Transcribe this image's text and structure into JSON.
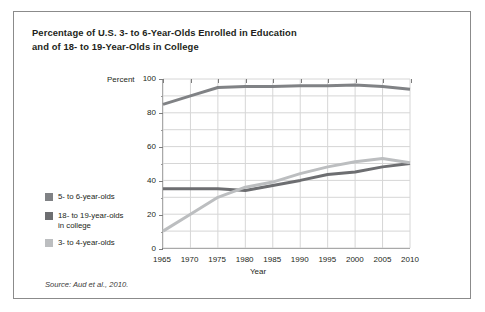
{
  "figure": {
    "title_line1": "Percentage of U.S. 3- to 6-Year-Olds Enrolled in Education",
    "title_line2": "and of 18- to 19-Year-Olds in College",
    "source": "Source: Aud et al., 2010."
  },
  "axes": {
    "y_axis_label": "Percent",
    "x_axis_label": "Year",
    "y_ticks": [
      "0",
      "20",
      "40",
      "60",
      "80",
      "100"
    ],
    "x_ticks": [
      "1965",
      "1970",
      "1975",
      "1980",
      "1985",
      "1990",
      "1995",
      "2000",
      "2005",
      "2010"
    ]
  },
  "legend": {
    "items": [
      {
        "label": "5- to 6-year-olds",
        "color": "#808285"
      },
      {
        "label": "18- to 19-year-olds in college",
        "label_line1": "18- to 19-year-olds",
        "label_line2": "in college",
        "color": "#6d6e71"
      },
      {
        "label": "3- to 4-year-olds",
        "color": "#bcbec0"
      }
    ]
  },
  "chart_data": {
    "type": "line",
    "title": "Percentage of U.S. 3- to 6-Year-Olds Enrolled in Education and of 18- to 19-Year-Olds in College",
    "xlabel": "Year",
    "ylabel": "Percent",
    "x": [
      1965,
      1970,
      1975,
      1980,
      1985,
      1990,
      1995,
      2000,
      2005,
      2010
    ],
    "xlim": [
      1965,
      2010
    ],
    "ylim": [
      0,
      100
    ],
    "grid": true,
    "legend_position": "lower-left-outside",
    "series": [
      {
        "name": "5- to 6-year-olds",
        "color": "#808285",
        "values": [
          85,
          90,
          95,
          95.5,
          95.5,
          96,
          96,
          96.5,
          95.5,
          94
        ]
      },
      {
        "name": "18- to 19-year-olds in college",
        "color": "#6d6e71",
        "values": [
          35,
          35,
          35,
          34,
          37,
          40,
          43.5,
          45,
          48,
          50
        ]
      },
      {
        "name": "3- to 4-year-olds",
        "color": "#bcbec0",
        "values": [
          10,
          20,
          30,
          36,
          39,
          44,
          48,
          51,
          53,
          50.5
        ]
      }
    ]
  }
}
